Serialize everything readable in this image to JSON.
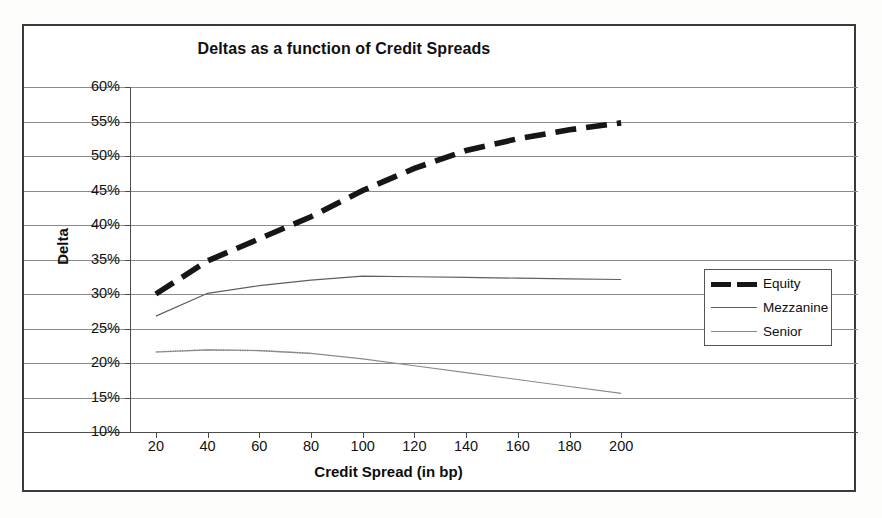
{
  "chart_data": {
    "type": "line",
    "title": "Deltas as a function of Credit Spreads",
    "xlabel": "Credit Spread (in bp)",
    "ylabel": "Delta",
    "xlim": [
      10,
      210
    ],
    "ylim": [
      10,
      60
    ],
    "ytick_labels": [
      "60%",
      "55%",
      "50%",
      "45%",
      "40%",
      "35%",
      "30%",
      "25%",
      "20%",
      "15%",
      "10%"
    ],
    "ytick_values": [
      60,
      55,
      50,
      45,
      40,
      35,
      30,
      25,
      20,
      15,
      10
    ],
    "xtick_labels": [
      "20",
      "40",
      "60",
      "80",
      "100",
      "120",
      "140",
      "160",
      "180",
      "200"
    ],
    "xtick_values": [
      20,
      40,
      60,
      80,
      100,
      120,
      140,
      160,
      180,
      200
    ],
    "grid": "horizontal",
    "legend_position": "right",
    "x": [
      20,
      40,
      60,
      80,
      100,
      120,
      140,
      160,
      180,
      200
    ],
    "series": [
      {
        "name": "Equity",
        "style": "thick-dashed",
        "color": "#1a1a1a",
        "values": [
          30.0,
          34.8,
          38.0,
          41.2,
          45.0,
          48.2,
          50.8,
          52.5,
          53.8,
          54.8
        ]
      },
      {
        "name": "Mezzanine",
        "style": "thin-solid",
        "color": "#555555",
        "values": [
          26.8,
          30.1,
          31.2,
          32.0,
          32.6,
          32.5,
          32.4,
          32.3,
          32.2,
          32.1
        ]
      },
      {
        "name": "Senior",
        "style": "thin-solid",
        "color": "#777777",
        "values": [
          21.6,
          21.9,
          21.8,
          21.4,
          20.6,
          19.6,
          18.6,
          17.6,
          16.6,
          15.6
        ]
      }
    ]
  },
  "legend": {
    "items": [
      {
        "label": "Equity"
      },
      {
        "label": "Mezzanine"
      },
      {
        "label": "Senior"
      }
    ]
  }
}
